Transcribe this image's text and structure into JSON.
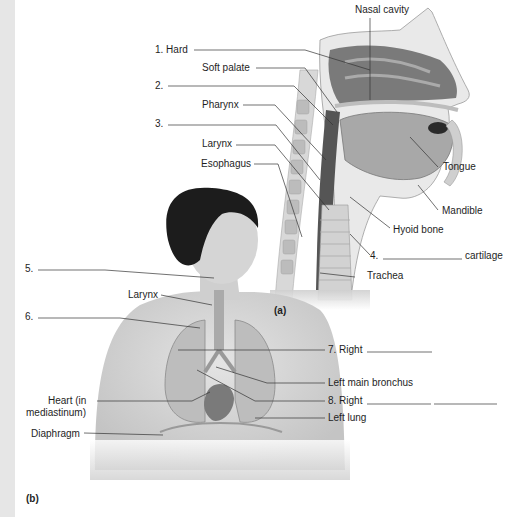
{
  "figure": {
    "panels": [
      {
        "id": "a",
        "label": "(a)"
      },
      {
        "id": "b",
        "label": "(b)"
      }
    ],
    "panel_a_labels": {
      "nasal_cavity": "Nasal cavity",
      "hard": "1. Hard",
      "soft_palate": "Soft palate",
      "blank_2": "2.",
      "pharynx": "Pharynx",
      "blank_3": "3.",
      "larynx": "Larynx",
      "esophagus": "Esophagus",
      "tongue": "Tongue",
      "mandible": "Mandible",
      "hyoid_bone": "Hyoid bone",
      "blank_4": "4.",
      "cartilage": "cartilage",
      "trachea": "Trachea"
    },
    "panel_b_labels": {
      "blank_5": "5.",
      "larynx": "Larynx",
      "blank_6": "6.",
      "right_7": "7. Right",
      "left_main_bronchus": "Left main bronchus",
      "right_8": "8. Right",
      "heart_line1": "Heart (in",
      "heart_line2": "mediastinum)",
      "left_lung": "Left lung",
      "diaphragm": "Diaphragm"
    },
    "colors": {
      "background": "#ffffff",
      "left_strip": "#e6e6e6",
      "leader_line": "#333333",
      "hair": "#1c1c1c",
      "skin": "#d9d9d9",
      "tissue_dark": "#5a5a5a",
      "tissue_mid": "#9a9a9a",
      "tissue_light": "#c8c8c8"
    }
  }
}
